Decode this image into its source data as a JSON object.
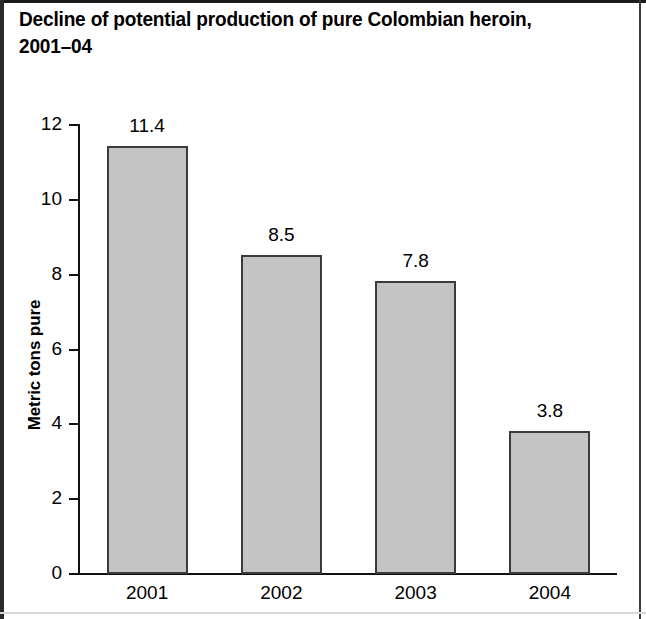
{
  "figure": {
    "title": "Decline of potential production of pure Colombian heroin,\n2001–04"
  },
  "chart_data": {
    "type": "bar",
    "title": "Decline of potential production of pure Colombian heroin, 2001–04",
    "categories": [
      "2001",
      "2002",
      "2003",
      "2004"
    ],
    "values": [
      11.4,
      8.5,
      7.8,
      3.8
    ],
    "value_labels": [
      "11.4",
      "8.5",
      "7.8",
      "3.8"
    ],
    "xlabel": "",
    "ylabel": "Metric tons pure",
    "ylim": [
      0,
      12
    ],
    "yticks": [
      0,
      2,
      4,
      6,
      8,
      10,
      12
    ],
    "ytick_labels": [
      "0",
      "2",
      "4",
      "6",
      "8",
      "10",
      "12"
    ],
    "grid": false,
    "legend": null,
    "bar_fill_color": "#c4c4c4",
    "bar_edge_color": "#3b3b3b",
    "axis_color": "#111111",
    "background_color": "#ffffff"
  }
}
